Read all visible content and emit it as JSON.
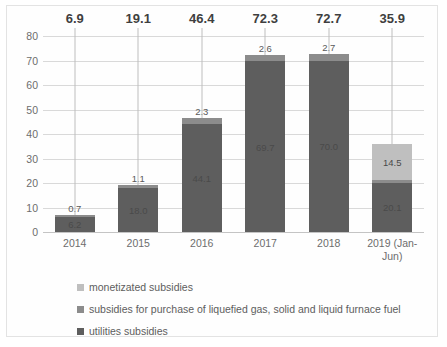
{
  "chart_data": {
    "type": "bar",
    "subtype": "stacked-bar",
    "title": "",
    "xlabel": "",
    "ylabel": "",
    "ylim": [
      0,
      80
    ],
    "ytick_step": 10,
    "yticks": [
      "80",
      "70",
      "60",
      "50",
      "40",
      "30",
      "20",
      "10",
      "0"
    ],
    "grid": true,
    "legend_position": "bottom-left",
    "categories": [
      "2014",
      "2015",
      "2016",
      "2017",
      "2018",
      "2019 (Jan-Jun)"
    ],
    "series": [
      {
        "name": "utilities subsidies",
        "color": "#5e5e5e",
        "values": [
          6.2,
          18.0,
          44.1,
          69.7,
          70.0,
          20.1
        ],
        "labels": [
          "6.2",
          "18.0",
          "44.1",
          "69.7",
          "70.0",
          "20.1"
        ]
      },
      {
        "name": "subsidies for purchase of liquefied gas, solid and liquid furnace fuel",
        "color": "#8c8c8c",
        "values": [
          0.7,
          1.1,
          2.3,
          2.6,
          2.7,
          1.3
        ],
        "labels": [
          "0.7",
          "1.1",
          "2.3",
          "2.6",
          "2.7",
          "1.3"
        ]
      },
      {
        "name": "monetized subsidies",
        "color": "#bfbfbf",
        "values": [
          0,
          0,
          0,
          0,
          0,
          14.5
        ],
        "labels": [
          "",
          "",
          "",
          "",
          "",
          "14.5"
        ]
      }
    ],
    "totals": [
      6.9,
      19.1,
      46.4,
      72.3,
      72.7,
      35.9
    ],
    "total_labels": [
      "6.9",
      "19.1",
      "46.4",
      "72.3",
      "72.7",
      "35.9"
    ]
  },
  "legend": {
    "items": [
      {
        "label": "monetizated subsidies",
        "color": "#bfbfbf"
      },
      {
        "label": "subsidies for purchase of liquefied gas, solid and liquid furnace fuel",
        "color": "#8c8c8c"
      },
      {
        "label": "utilities subsidies",
        "color": "#5e5e5e"
      }
    ]
  },
  "colors": {
    "gridline": "#d9d9d9",
    "axis_text": "#6d6d6d",
    "total_text": "#3f3f3f",
    "frame_border": "#e3e3e3",
    "background": "#ffffff"
  }
}
